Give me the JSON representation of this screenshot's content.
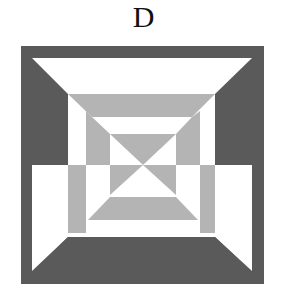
{
  "figure": {
    "label": "D",
    "colors": {
      "dark": "#5a5a5a",
      "light": "#b4b4b4",
      "white": "#ffffff"
    }
  }
}
